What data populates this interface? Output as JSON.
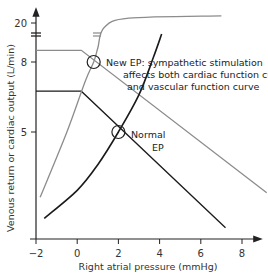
{
  "chart_data": {
    "type": "line",
    "title": "",
    "xlabel": "Right atrial pressure (mmHg)",
    "ylabel": "Venous return or cardiac output (L/min)",
    "xlim": [
      -2,
      9
    ],
    "x_ticks": [
      -2,
      0,
      2,
      4,
      6,
      8
    ],
    "x_tick_labels": [
      "−2",
      "0",
      "2",
      "4",
      "6",
      "8"
    ],
    "y_ticks": [
      5,
      8,
      20
    ],
    "y_tick_labels": [
      "5",
      "8",
      "20"
    ],
    "y_axis_break": "between 8 and 20",
    "grid": false,
    "legend": "none",
    "series": [
      {
        "name": "Normal vascular function curve",
        "color": "#1a1a1a",
        "points": [
          [
            -2,
            6.75
          ],
          [
            0.2,
            6.75
          ],
          [
            7.2,
            0.9
          ]
        ]
      },
      {
        "name": "Vascular function curve with sympathetic stimulation",
        "color": "#8c8c8c",
        "points": [
          [
            -2,
            8.5
          ],
          [
            0.2,
            8.5
          ],
          [
            9.2,
            2.4
          ]
        ]
      },
      {
        "name": "Normal cardiac function curve",
        "color": "#1a1a1a",
        "points": [
          [
            -1.6,
            1.3
          ],
          [
            0,
            2.5
          ],
          [
            1,
            3.6
          ],
          [
            2,
            5.0
          ],
          [
            3,
            6.6
          ],
          [
            3.7,
            8.2
          ],
          [
            4.1,
            9.2
          ]
        ]
      },
      {
        "name": "Cardiac function curve with sympathetic stimulation",
        "color": "#8c8c8c",
        "points": [
          [
            -1.8,
            2.2
          ],
          [
            -0.5,
            5.0
          ],
          [
            0.4,
            7.2
          ],
          [
            0.8,
            8.0
          ],
          [
            1.0,
            8.6
          ],
          [
            1.3,
            19.6
          ],
          [
            2.5,
            20.4
          ],
          [
            7,
            20.6
          ]
        ]
      }
    ],
    "equilibrium_points": [
      {
        "name": "Normal EP",
        "x": 2.0,
        "y": 5.0
      },
      {
        "name": "New EP",
        "x": 0.8,
        "y": 8.0
      }
    ],
    "annotations": {
      "new_ep_lines": [
        "New EP: sympathetic stimulation",
        "affects both cardiac function curve",
        "and vascular function curve"
      ],
      "normal_ep_lines": [
        "Normal",
        "EP"
      ]
    }
  }
}
